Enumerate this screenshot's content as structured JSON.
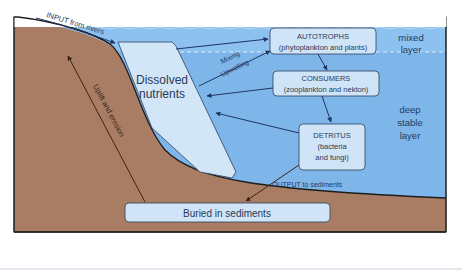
{
  "diagram": {
    "colors": {
      "water_deep": "#7fb6ea",
      "water_mixed": "#8fc0ef",
      "land": "#a87d63",
      "box_fill": "#cfe4f7",
      "nutrients_fill": "#d2e6f8",
      "outline": "#2b2b2b",
      "arrow": "#1f3560",
      "text": "#2a3a55"
    },
    "layers": {
      "mixed": [
        "mixed",
        "layer"
      ],
      "deep": [
        "deep",
        "stable",
        "layer"
      ]
    },
    "nodes": {
      "nutrients": [
        "Dissolved",
        "nutrients"
      ],
      "autotrophs": [
        "AUTOTROPHS",
        "(phytoplankton and plants)"
      ],
      "consumers": [
        "CONSUMERS",
        "(zooplankton and nekton)"
      ],
      "detritus": [
        "DETRITUS",
        "(bacteria",
        "and fungi)"
      ],
      "buried": "Buried in sediments"
    },
    "flows": {
      "input": "INPUT from rivers",
      "mixing": "Mixing",
      "upwelling": "Upwelling",
      "output": "OUTPUT to sediments",
      "uplift": "Uplift and erosion"
    }
  }
}
